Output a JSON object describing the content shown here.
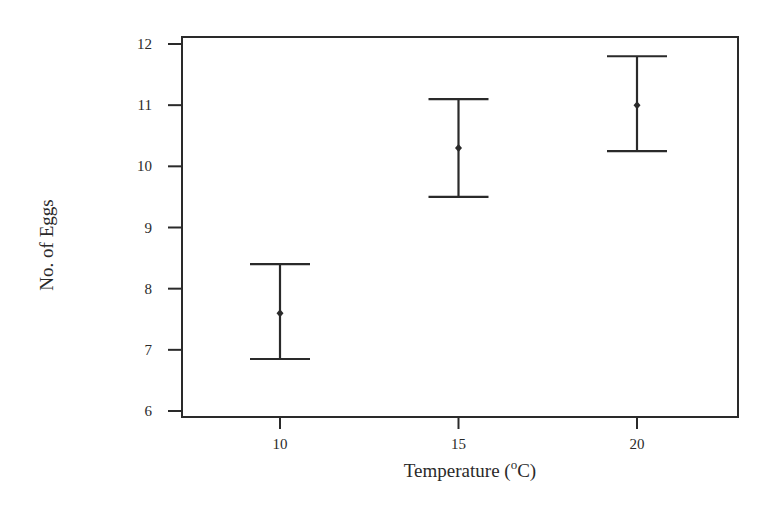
{
  "chart_data": {
    "type": "errorbar",
    "title": "",
    "xlabel": "Temperature (°C)",
    "xlabel_parts": {
      "prefix": "Temperature (",
      "sup": "o",
      "suffix": "C)"
    },
    "ylabel": "No. of Eggs",
    "categories": [
      10,
      15,
      20
    ],
    "x": [
      10,
      15,
      20
    ],
    "series": [
      {
        "name": "No. of Eggs",
        "mean": [
          7.6,
          10.3,
          11.0
        ],
        "upper": [
          8.4,
          11.1,
          11.8
        ],
        "lower": [
          6.85,
          9.5,
          10.25
        ]
      }
    ],
    "xticks": [
      10,
      15,
      20
    ],
    "yticks": [
      6,
      7,
      8,
      9,
      10,
      11,
      12
    ],
    "xlim": [
      7.3,
      22.8
    ],
    "ylim": [
      5.9,
      12.1
    ],
    "grid": false,
    "legend": null
  },
  "colors": {
    "ink": "#2a2a2a",
    "background": "#ffffff"
  }
}
